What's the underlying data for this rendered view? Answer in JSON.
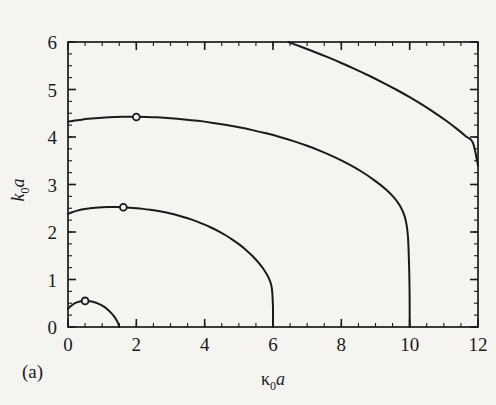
{
  "figure": {
    "caption": "(a)",
    "background_color": "#f6f4f1",
    "line_color": "#1a1a1a"
  },
  "chart_data": {
    "type": "line",
    "title": "",
    "xlabel": "κ₀a",
    "ylabel": "k₀a",
    "xlabel_parts": {
      "base": "κ",
      "sub": "0",
      "italic": "a"
    },
    "ylabel_parts": {
      "base": "k",
      "sub": "0",
      "italic": "a"
    },
    "xlim": [
      0,
      12
    ],
    "ylim": [
      0,
      6
    ],
    "xticks": [
      0,
      2,
      4,
      6,
      8,
      10,
      12
    ],
    "xtick_labels": [
      "0",
      "2",
      "4",
      "6",
      "8",
      "10",
      "12"
    ],
    "yticks": [
      0,
      1,
      2,
      3,
      4,
      5,
      6
    ],
    "ytick_labels": [
      "0",
      "1",
      "2",
      "3",
      "4",
      "5",
      "6"
    ],
    "x_minor_step": 0.5,
    "y_minor_step": 0.25,
    "grid": false,
    "legend": null,
    "frame": "box",
    "tick_direction": "in",
    "series": [
      {
        "name": "mode-1",
        "marker": {
          "shape": "circle",
          "x": 0.5,
          "y": 0.55,
          "filled": false
        },
        "points": [
          [
            0.0,
            0.38
          ],
          [
            0.05,
            0.42
          ],
          [
            0.1,
            0.45
          ],
          [
            0.15,
            0.48
          ],
          [
            0.2,
            0.5
          ],
          [
            0.25,
            0.515
          ],
          [
            0.3,
            0.528
          ],
          [
            0.35,
            0.538
          ],
          [
            0.4,
            0.545
          ],
          [
            0.45,
            0.549
          ],
          [
            0.5,
            0.551
          ],
          [
            0.55,
            0.55
          ],
          [
            0.6,
            0.547
          ],
          [
            0.65,
            0.542
          ],
          [
            0.7,
            0.535
          ],
          [
            0.75,
            0.526
          ],
          [
            0.8,
            0.515
          ],
          [
            0.85,
            0.502
          ],
          [
            0.9,
            0.487
          ],
          [
            0.95,
            0.47
          ],
          [
            1.0,
            0.45
          ],
          [
            1.05,
            0.428
          ],
          [
            1.1,
            0.403
          ],
          [
            1.15,
            0.375
          ],
          [
            1.2,
            0.343
          ],
          [
            1.25,
            0.308
          ],
          [
            1.3,
            0.268
          ],
          [
            1.35,
            0.222
          ],
          [
            1.4,
            0.17
          ],
          [
            1.43,
            0.132
          ],
          [
            1.46,
            0.09
          ],
          [
            1.48,
            0.055
          ],
          [
            1.5,
            0.0
          ]
        ]
      },
      {
        "name": "mode-2",
        "marker": {
          "shape": "circle",
          "x": 1.62,
          "y": 2.52,
          "filled": false
        },
        "points": [
          [
            0.0,
            2.38
          ],
          [
            0.1,
            2.41
          ],
          [
            0.2,
            2.435
          ],
          [
            0.3,
            2.455
          ],
          [
            0.4,
            2.472
          ],
          [
            0.5,
            2.486
          ],
          [
            0.6,
            2.497
          ],
          [
            0.7,
            2.506
          ],
          [
            0.8,
            2.513
          ],
          [
            0.9,
            2.518
          ],
          [
            1.0,
            2.521
          ],
          [
            1.2,
            2.524
          ],
          [
            1.4,
            2.524
          ],
          [
            1.62,
            2.52
          ],
          [
            1.8,
            2.513
          ],
          [
            2.0,
            2.502
          ],
          [
            2.2,
            2.487
          ],
          [
            2.4,
            2.468
          ],
          [
            2.6,
            2.446
          ],
          [
            2.8,
            2.419
          ],
          [
            3.0,
            2.388
          ],
          [
            3.2,
            2.352
          ],
          [
            3.4,
            2.311
          ],
          [
            3.6,
            2.265
          ],
          [
            3.8,
            2.213
          ],
          [
            4.0,
            2.155
          ],
          [
            4.2,
            2.09
          ],
          [
            4.4,
            2.018
          ],
          [
            4.6,
            1.937
          ],
          [
            4.8,
            1.846
          ],
          [
            5.0,
            1.744
          ],
          [
            5.2,
            1.628
          ],
          [
            5.4,
            1.494
          ],
          [
            5.6,
            1.336
          ],
          [
            5.7,
            1.243
          ],
          [
            5.8,
            1.133
          ],
          [
            5.88,
            1.025
          ],
          [
            5.93,
            0.93
          ],
          [
            5.96,
            0.84
          ],
          [
            5.98,
            0.72
          ],
          [
            5.99,
            0.58
          ],
          [
            6.0,
            0.4
          ],
          [
            6.0,
            0.0
          ]
        ]
      },
      {
        "name": "mode-3",
        "marker": {
          "shape": "circle",
          "x": 2.0,
          "y": 4.42,
          "filled": false
        },
        "points": [
          [
            0.0,
            4.32
          ],
          [
            0.2,
            4.345
          ],
          [
            0.4,
            4.365
          ],
          [
            0.6,
            4.382
          ],
          [
            0.8,
            4.396
          ],
          [
            1.0,
            4.407
          ],
          [
            1.2,
            4.415
          ],
          [
            1.4,
            4.421
          ],
          [
            1.6,
            4.425
          ],
          [
            1.8,
            4.427
          ],
          [
            2.0,
            4.427
          ],
          [
            2.3,
            4.423
          ],
          [
            2.6,
            4.414
          ],
          [
            3.0,
            4.396
          ],
          [
            3.4,
            4.371
          ],
          [
            3.8,
            4.34
          ],
          [
            4.2,
            4.302
          ],
          [
            4.6,
            4.257
          ],
          [
            5.0,
            4.205
          ],
          [
            5.4,
            4.145
          ],
          [
            5.8,
            4.077
          ],
          [
            6.2,
            4.0
          ],
          [
            6.6,
            3.913
          ],
          [
            7.0,
            3.815
          ],
          [
            7.4,
            3.704
          ],
          [
            7.8,
            3.578
          ],
          [
            8.2,
            3.434
          ],
          [
            8.6,
            3.268
          ],
          [
            9.0,
            3.072
          ],
          [
            9.3,
            2.9
          ],
          [
            9.55,
            2.72
          ],
          [
            9.72,
            2.55
          ],
          [
            9.84,
            2.36
          ],
          [
            9.91,
            2.15
          ],
          [
            9.95,
            1.9
          ],
          [
            9.97,
            1.6
          ],
          [
            9.985,
            1.25
          ],
          [
            9.995,
            0.85
          ],
          [
            10.0,
            0.45
          ],
          [
            10.0,
            0.0
          ]
        ]
      },
      {
        "name": "mode-4",
        "marker": null,
        "points": [
          [
            6.45,
            6.0
          ],
          [
            6.8,
            5.905
          ],
          [
            7.2,
            5.795
          ],
          [
            7.6,
            5.68
          ],
          [
            8.0,
            5.558
          ],
          [
            8.4,
            5.43
          ],
          [
            8.8,
            5.295
          ],
          [
            9.2,
            5.152
          ],
          [
            9.6,
            5.0
          ],
          [
            10.0,
            4.838
          ],
          [
            10.4,
            4.664
          ],
          [
            10.8,
            4.476
          ],
          [
            11.1,
            4.325
          ],
          [
            11.4,
            4.16
          ],
          [
            11.65,
            4.012
          ],
          [
            11.85,
            3.88
          ],
          [
            12.0,
            3.4
          ]
        ]
      }
    ]
  }
}
